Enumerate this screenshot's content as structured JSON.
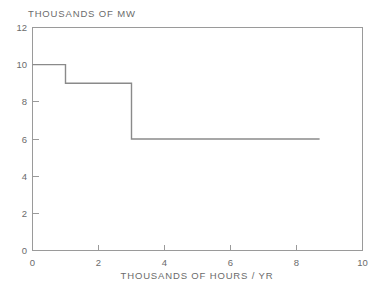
{
  "chart_data": {
    "type": "line",
    "subtype": "step-post",
    "title": "",
    "ylabel": "THOUSANDS OF MW",
    "xlabel": "THOUSANDS OF HOURS / YR",
    "xlim": [
      0,
      10
    ],
    "ylim": [
      0,
      12
    ],
    "xticks": [
      0,
      2,
      4,
      6,
      8,
      10
    ],
    "yticks": [
      0,
      2,
      4,
      6,
      8,
      10,
      12
    ],
    "xtick_labels": [
      "0",
      "2",
      "4",
      "6",
      "8",
      "10"
    ],
    "ytick_labels": [
      "0",
      "2",
      "4",
      "6",
      "8",
      "10",
      "12"
    ],
    "grid": false,
    "legend": false,
    "legend_position": "none",
    "series": [
      {
        "name": "load duration",
        "step_segments": [
          {
            "x_start": 0,
            "x_end": 1,
            "y": 10
          },
          {
            "x_start": 1,
            "x_end": 3,
            "y": 9
          },
          {
            "x_start": 3,
            "x_end": 8.7,
            "y": 6
          }
        ],
        "x": [
          0,
          1,
          1,
          3,
          3,
          8.7
        ],
        "y": [
          10,
          10,
          9,
          9,
          6,
          6
        ],
        "color": "#8a8a8a",
        "line_width": 1.4
      }
    ],
    "frame": {
      "box": true,
      "color": "#9a9a9a",
      "tick_sides": [
        "left",
        "bottom"
      ]
    },
    "background_color": "#ffffff",
    "text_color": "#6b6b6b"
  },
  "labels": {
    "y_axis_title": "THOUSANDS OF MW",
    "x_axis_title": "THOUSANDS OF HOURS / YR"
  }
}
